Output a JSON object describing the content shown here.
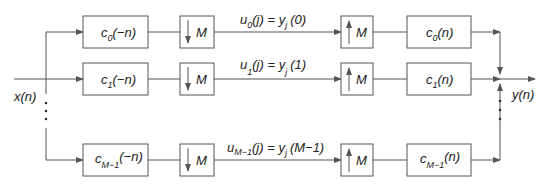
{
  "diagram": {
    "title": "",
    "input_label": "x(n)",
    "output_label": "y(n)",
    "rows": [
      {
        "analysis_filter": {
          "base": "c",
          "sub": "0",
          "arg": "(−n)"
        },
        "downsampler": "M",
        "signal": {
          "u_sub": "0",
          "lhs_arg": "(j)",
          "eq": "=",
          "y_sub": "j",
          "rhs_arg": "(0)"
        },
        "upsampler": "M",
        "synthesis_filter": {
          "base": "c",
          "sub": "0",
          "arg": "(n)"
        }
      },
      {
        "analysis_filter": {
          "base": "c",
          "sub": "1",
          "arg": "(−n)"
        },
        "downsampler": "M",
        "signal": {
          "u_sub": "1",
          "lhs_arg": "(j)",
          "eq": "=",
          "y_sub": "j",
          "rhs_arg": "(1)"
        },
        "upsampler": "M",
        "synthesis_filter": {
          "base": "c",
          "sub": "1",
          "arg": "(n)"
        }
      },
      {
        "analysis_filter": {
          "base": "c",
          "sub": "M−1",
          "arg": "(−n)"
        },
        "downsampler": "M",
        "signal": {
          "u_sub": "M−1",
          "lhs_arg": "(j)",
          "eq": "=",
          "y_sub": "j",
          "rhs_arg": "(M−1)"
        },
        "upsampler": "M",
        "synthesis_filter": {
          "base": "c",
          "sub": "M−1",
          "arg": "(n)"
        }
      }
    ],
    "ellipsis": "⋮",
    "colors": {
      "line": "#555555",
      "text": "#222222",
      "background": "#ffffff"
    }
  }
}
